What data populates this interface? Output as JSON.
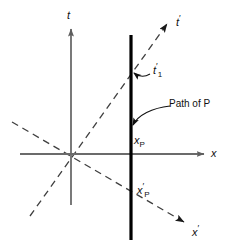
{
  "figure": {
    "type": "spacetime-diagram",
    "background_color": "#ffffff",
    "axis_color": "#6b6b6b",
    "worldline_color": "#000000",
    "dashed_color": "#4a4a4a",
    "text_color": "#111111"
  },
  "axes": {
    "time_axis": {
      "label": "t",
      "label_prime": "",
      "orientation": "vertical",
      "origin_px": [
        71,
        154
      ],
      "tip_px": [
        71,
        26
      ],
      "tail_px": [
        71,
        205
      ]
    },
    "space_axis": {
      "label": "x",
      "orientation": "horizontal",
      "origin_px": [
        71,
        154
      ],
      "tip_px": [
        207,
        154
      ],
      "tail_px": [
        20,
        154
      ]
    },
    "time_axis_primed": {
      "label": "t",
      "prime": "′",
      "tip_px": [
        170,
        21
      ],
      "tail_px": [
        30,
        216
      ]
    },
    "space_axis_primed": {
      "label": "x",
      "prime": "′",
      "tip_px": [
        187,
        224
      ],
      "tail_px": [
        12,
        122
      ]
    }
  },
  "worldline": {
    "name": "Path of P",
    "annotation_label": "Path of P",
    "x_px": 131,
    "top_px": 35,
    "bottom_px": 240,
    "arrow_target_px": [
      131,
      128
    ]
  },
  "events": {
    "t1_prime": {
      "base": "t",
      "prime": "′",
      "subscript": "1",
      "full": "t′1",
      "marker_px": [
        131,
        72
      ],
      "label_px": [
        153,
        64
      ]
    },
    "x_p": {
      "base": "x",
      "prime": "",
      "subscript": "P",
      "full": "xP",
      "label_px": [
        134,
        136
      ]
    },
    "x_p_prime": {
      "base": "x",
      "prime": "′",
      "subscript": "P",
      "full": "x′P",
      "label_px": [
        137,
        183
      ]
    }
  }
}
